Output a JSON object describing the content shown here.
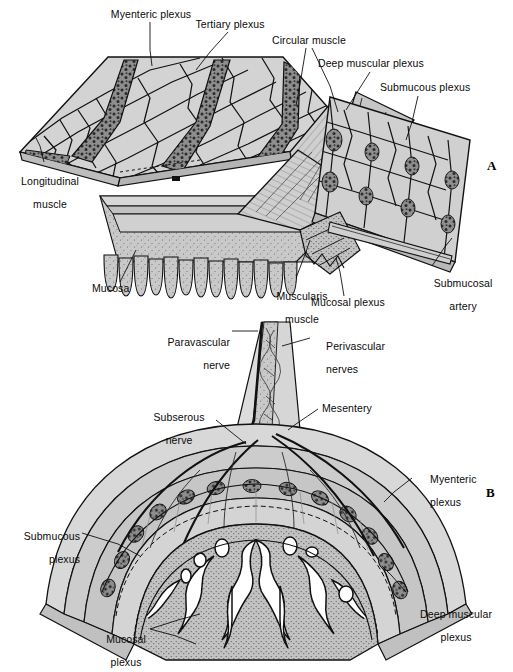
{
  "figure": {
    "panels": [
      {
        "letter": "A",
        "name": "cutaway-three-dimensional-view",
        "labels": [
          {
            "id": "myenteric-plexus",
            "text": "Myenteric plexus",
            "lines": [
              "Myenteric plexus"
            ]
          },
          {
            "id": "tertiary-plexus",
            "text": "Tertiary plexus",
            "lines": [
              "Tertiary plexus"
            ]
          },
          {
            "id": "circular-muscle",
            "text": "Circular muscle",
            "lines": [
              "Circular muscle"
            ]
          },
          {
            "id": "deep-muscular-plexus",
            "text": "Deep muscular plexus",
            "lines": [
              "Deep muscular plexus"
            ]
          },
          {
            "id": "submucous-plexus",
            "text": "Submucous plexus",
            "lines": [
              "Submucous plexus"
            ]
          },
          {
            "id": "longitudinal-muscle",
            "text": "Longitudinal muscle",
            "lines": [
              "Longitudinal",
              "muscle"
            ]
          },
          {
            "id": "mucosa",
            "text": "Mucosa",
            "lines": [
              "Mucosa"
            ]
          },
          {
            "id": "muscularis-muscle",
            "text": "Muscularis muscle",
            "lines": [
              "Muscularis",
              "muscle"
            ]
          },
          {
            "id": "mucosal-plexus",
            "text": "Mucosal plexus",
            "lines": [
              "Mucosal plexus"
            ]
          },
          {
            "id": "submucosal-artery",
            "text": "Submucosal artery",
            "lines": [
              "Submucosal",
              "artery"
            ]
          }
        ]
      },
      {
        "letter": "B",
        "name": "cross-section-with-mesentery",
        "labels": [
          {
            "id": "paravascular-nerve",
            "text": "Paravascular nerve",
            "lines": [
              "Paravascular",
              "nerve"
            ]
          },
          {
            "id": "perivascular-nerves",
            "text": "Perivascular nerves",
            "lines": [
              "Perivascular",
              "nerves"
            ]
          },
          {
            "id": "subserous-nerve",
            "text": "Subserous nerve",
            "lines": [
              "Subserous",
              "nerve"
            ]
          },
          {
            "id": "mesentery",
            "text": "Mesentery",
            "lines": [
              "Mesentery"
            ]
          },
          {
            "id": "myenteric-plexus-b",
            "text": "Myenteric plexus",
            "lines": [
              "Myenteric",
              "plexus"
            ]
          },
          {
            "id": "submucous-plexus-b",
            "text": "Submucous plexus",
            "lines": [
              "Submucous",
              "plexus"
            ]
          },
          {
            "id": "mucosal-plexus-b",
            "text": "Mucosal plexus",
            "lines": [
              "Mucosal",
              "plexus"
            ]
          },
          {
            "id": "deep-muscular-plexus-b",
            "text": "Deep muscular plexus",
            "lines": [
              "Deep muscular",
              "plexus"
            ]
          }
        ]
      }
    ],
    "label_text": {
      "myenteric_plexus": "Myenteric plexus",
      "tertiary_plexus": "Tertiary plexus",
      "circular_muscle": "Circular muscle",
      "deep_muscular_plexus": "Deep muscular plexus",
      "submucous_plexus": "Submucous plexus",
      "longitudinal_muscle_l1": "Longitudinal",
      "longitudinal_muscle_l2": "muscle",
      "mucosa": "Mucosa",
      "muscularis_muscle_l1": "Muscularis",
      "muscularis_muscle_l2": "muscle",
      "mucosal_plexus": "Mucosal plexus",
      "submucosal_artery_l1": "Submucosal",
      "submucosal_artery_l2": "artery",
      "paravascular_nerve_l1": "Paravascular",
      "paravascular_nerve_l2": "nerve",
      "perivascular_nerves_l1": "Perivascular",
      "perivascular_nerves_l2": "nerves",
      "subserous_nerve_l1": "Subserous",
      "subserous_nerve_l2": "nerve",
      "mesentery": "Mesentery",
      "myenteric_plexus_b_l1": "Myenteric",
      "myenteric_plexus_b_l2": "plexus",
      "submucous_plexus_b_l1": "Submucous",
      "submucous_plexus_b_l2": "plexus",
      "mucosal_plexus_b_l1": "Mucosal",
      "mucosal_plexus_b_l2": "plexus",
      "deep_muscular_plexus_b_l1": "Deep muscular",
      "deep_muscular_plexus_b_l2": "plexus",
      "panel_a_letter": "A",
      "panel_b_letter": "B"
    },
    "colors": {
      "background": "#ffffff",
      "ink": "#0a0a0a",
      "tissue_fill": "#c9c9c9",
      "tissue_fill_light": "#dcdcdc",
      "tissue_fill_dark": "#a8a8a8",
      "plexus_dark": "#4a4a4a",
      "lumen": "#ffffff"
    }
  }
}
